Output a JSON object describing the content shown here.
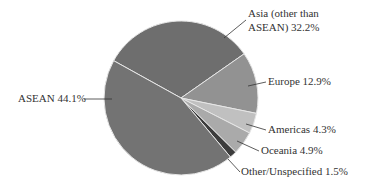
{
  "chart_data": {
    "type": "pie",
    "title": "",
    "categories": [
      "Asia (other than ASEAN)",
      "Europe",
      "Americas",
      "Oceania",
      "Other/Unspecified",
      "ASEAN"
    ],
    "values": [
      32.2,
      12.9,
      4.3,
      4.9,
      1.5,
      44.1
    ],
    "unit": "%",
    "colors": [
      "#6e6e6e",
      "#929292",
      "#c0c0c0",
      "#aaaaaa",
      "#3c3c3c",
      "#737373"
    ],
    "start_angle_deg": -151,
    "direction": "clockwise",
    "legend": "none (direct labels with leader lines)"
  },
  "labels": {
    "asia_line1": "Asia (other than",
    "asia_line2": "ASEAN) 32.2%",
    "europe": "Europe 12.9%",
    "americas": "Americas 4.3%",
    "oceania": "Oceania 4.9%",
    "other": "Other/Unspecified 1.5%",
    "asean": "ASEAN 44.1%"
  }
}
